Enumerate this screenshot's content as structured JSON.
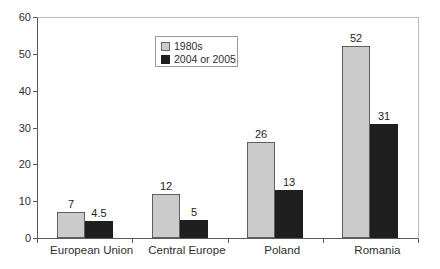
{
  "chart_data": {
    "type": "bar",
    "title": "",
    "xlabel": "",
    "ylabel": "",
    "categories": [
      "European Union",
      "Central Europe",
      "Poland",
      "Romania"
    ],
    "series": [
      {
        "name": "1980s",
        "color": "#cbcbcb",
        "border": "#5f5f5f",
        "values": [
          7,
          12,
          26,
          52
        ]
      },
      {
        "name": "2004 or 2005",
        "color": "#1f1f1f",
        "border": "#1f1f1f",
        "values": [
          4.5,
          5,
          13,
          31
        ]
      }
    ],
    "value_labels": [
      [
        "7",
        "12",
        "26",
        "52"
      ],
      [
        "4.5",
        "5",
        "13",
        "31"
      ]
    ],
    "ylim": [
      0,
      60
    ],
    "yticks": [
      0,
      10,
      20,
      30,
      40,
      50,
      60
    ],
    "grid": false,
    "legend_position": "top-center"
  },
  "colors": {
    "axis": "#5a5a5a",
    "plot_border": "#bdbdbd",
    "text": "#2e2e2e",
    "background": "#ffffff",
    "legend_border": "#9a9a9a"
  }
}
